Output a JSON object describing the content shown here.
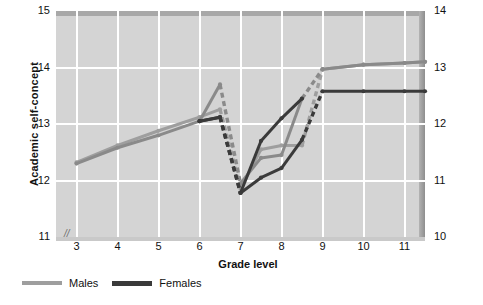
{
  "axes": {
    "y_left": {
      "title": "Academic self-concept",
      "ticks": [
        "15",
        "14",
        "13",
        "12",
        "11"
      ],
      "min": 11,
      "max": 15,
      "break_mark": "//"
    },
    "y_right": {
      "ticks": [
        "14",
        "13",
        "12",
        "11",
        "10"
      ],
      "min": 10,
      "max": 14
    },
    "x": {
      "title": "Grade level",
      "ticks": [
        "3",
        "4",
        "5",
        "6",
        "7",
        "8",
        "9",
        "10",
        "11"
      ],
      "min": 2.5,
      "max": 11.5
    }
  },
  "legend": {
    "items": [
      {
        "label": "Males",
        "color": "#9e9e9e"
      },
      {
        "label": "Females",
        "color": "#3a3a3a"
      }
    ]
  },
  "colors": {
    "panel": "#d4d4d4",
    "grid": "#ffffff",
    "males": "#9e9e9e",
    "males_dark": "#8a8a8a",
    "females": "#3a3a3a",
    "text": "#111111"
  },
  "chart_data": {
    "type": "line",
    "title": "",
    "xlabel": "Grade level",
    "ylabel": "Academic self-concept",
    "xlim": [
      2.5,
      11.5
    ],
    "ylim": [
      11,
      15
    ],
    "y_right_lim": [
      10,
      14
    ],
    "grid": true,
    "legend_position": "below-left",
    "series": [
      {
        "name": "Males cohort A",
        "color": "#9e9e9e",
        "style": "solid-with-dashed-transition",
        "points": [
          {
            "x": 3,
            "y": 12.32,
            "dashed_to_next": false
          },
          {
            "x": 4,
            "y": 12.62,
            "dashed_to_next": false
          },
          {
            "x": 5,
            "y": 12.88,
            "dashed_to_next": false
          },
          {
            "x": 6,
            "y": 13.12,
            "dashed_to_next": false
          },
          {
            "x": 6.5,
            "y": 13.26,
            "dashed_to_next": true
          },
          {
            "x": 7,
            "y": 11.85,
            "dashed_to_next": false
          },
          {
            "x": 7.5,
            "y": 12.55,
            "dashed_to_next": false
          },
          {
            "x": 8,
            "y": 12.62,
            "dashed_to_next": false
          },
          {
            "x": 8.5,
            "y": 12.62,
            "dashed_to_next": true
          },
          {
            "x": 9,
            "y": 13.97,
            "dashed_to_next": false
          },
          {
            "x": 10,
            "y": 14.05,
            "dashed_to_next": false
          },
          {
            "x": 11,
            "y": 14.08,
            "dashed_to_next": false
          },
          {
            "x": 11.5,
            "y": 14.1,
            "dashed_to_next": false
          }
        ]
      },
      {
        "name": "Males cohort B",
        "color": "#8a8a8a",
        "style": "solid-with-dashed-transition",
        "points": [
          {
            "x": 3,
            "y": 12.3,
            "dashed_to_next": false
          },
          {
            "x": 4,
            "y": 12.58,
            "dashed_to_next": false
          },
          {
            "x": 5,
            "y": 12.8,
            "dashed_to_next": false
          },
          {
            "x": 6,
            "y": 13.05,
            "dashed_to_next": false
          },
          {
            "x": 6.5,
            "y": 13.7,
            "dashed_to_next": true
          },
          {
            "x": 7,
            "y": 11.95,
            "dashed_to_next": false
          },
          {
            "x": 7.5,
            "y": 12.4,
            "dashed_to_next": false
          },
          {
            "x": 8,
            "y": 12.45,
            "dashed_to_next": false
          },
          {
            "x": 8.5,
            "y": 13.45,
            "dashed_to_next": true
          },
          {
            "x": 9,
            "y": 13.97,
            "dashed_to_next": false
          },
          {
            "x": 10,
            "y": 14.05,
            "dashed_to_next": false
          },
          {
            "x": 11,
            "y": 14.08,
            "dashed_to_next": false
          },
          {
            "x": 11.5,
            "y": 14.1,
            "dashed_to_next": false
          }
        ]
      },
      {
        "name": "Females cohort A",
        "color": "#3a3a3a",
        "style": "solid-with-dashed-transition",
        "points": [
          {
            "x": 6,
            "y": 13.05,
            "dashed_to_next": false
          },
          {
            "x": 6.5,
            "y": 13.12,
            "dashed_to_next": true
          },
          {
            "x": 7,
            "y": 11.78,
            "dashed_to_next": false
          },
          {
            "x": 7.5,
            "y": 12.05,
            "dashed_to_next": false
          },
          {
            "x": 8,
            "y": 12.22,
            "dashed_to_next": false
          },
          {
            "x": 8.5,
            "y": 12.72,
            "dashed_to_next": true
          },
          {
            "x": 9,
            "y": 13.58,
            "dashed_to_next": false
          },
          {
            "x": 10,
            "y": 13.58,
            "dashed_to_next": false
          },
          {
            "x": 11,
            "y": 13.58,
            "dashed_to_next": false
          },
          {
            "x": 11.5,
            "y": 13.58,
            "dashed_to_next": false
          }
        ]
      },
      {
        "name": "Females cohort B",
        "color": "#3a3a3a",
        "style": "solid-with-dashed-transition",
        "points": [
          {
            "x": 6,
            "y": 13.05,
            "dashed_to_next": false
          },
          {
            "x": 6.5,
            "y": 13.12,
            "dashed_to_next": true
          },
          {
            "x": 7,
            "y": 11.78,
            "dashed_to_next": false
          },
          {
            "x": 7.5,
            "y": 12.7,
            "dashed_to_next": false
          },
          {
            "x": 8,
            "y": 13.1,
            "dashed_to_next": false
          },
          {
            "x": 8.5,
            "y": 13.45,
            "dashed_to_next": false
          }
        ]
      }
    ]
  }
}
